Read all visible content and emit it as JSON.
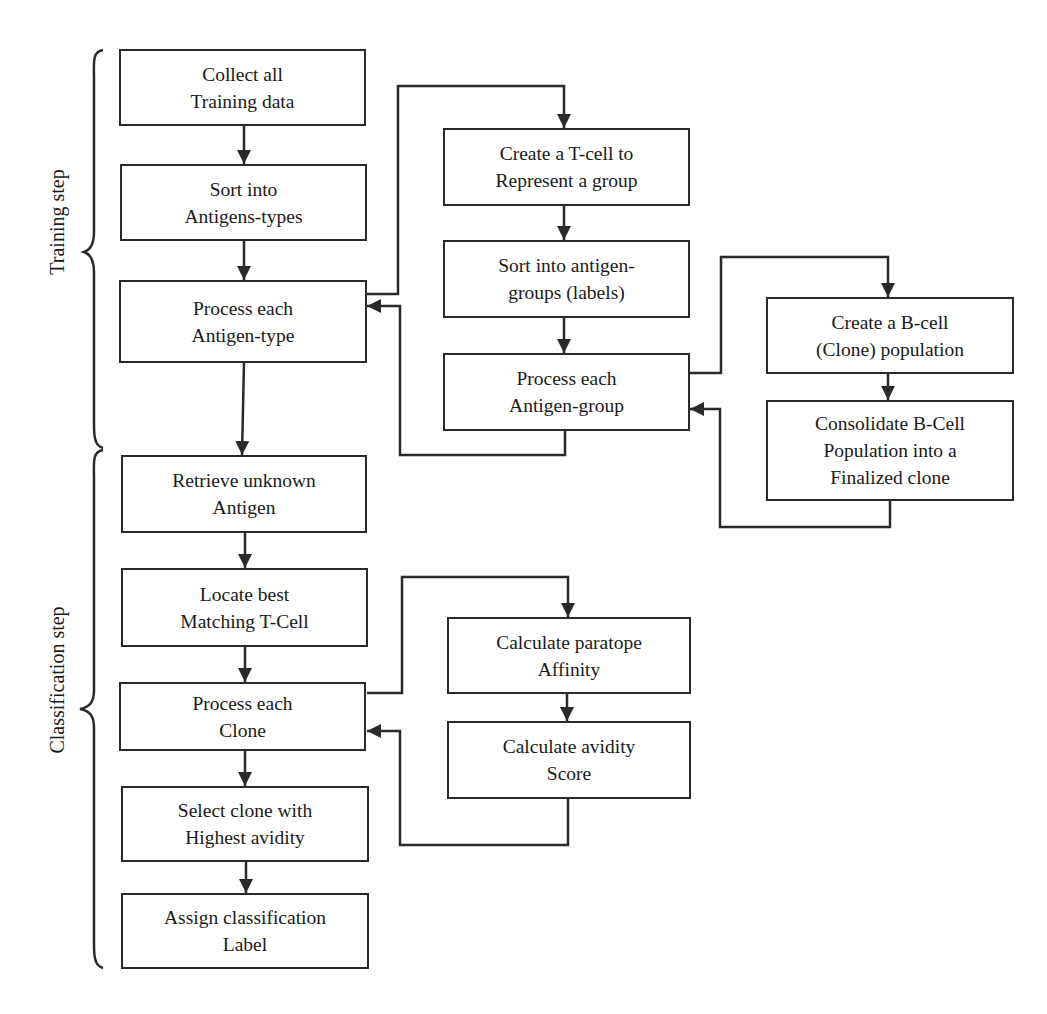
{
  "diagram": {
    "type": "flowchart",
    "colors": {
      "stroke": "#2a2a2a",
      "background": "#ffffff",
      "text": "#1a1a1a"
    },
    "phases": {
      "training": {
        "label": "Training step"
      },
      "classification": {
        "label": "Classification step"
      }
    },
    "nodes": {
      "collect": {
        "line1": "Collect all",
        "line2": "Training data"
      },
      "sort_types": {
        "line1": "Sort into",
        "line2": "Antigens-types"
      },
      "process_type": {
        "line1": "Process each",
        "line2": "Antigen-type"
      },
      "create_tcell": {
        "line1": "Create a T-cell to",
        "line2": "Represent a group"
      },
      "sort_groups": {
        "line1": "Sort into antigen-",
        "line2": "groups (labels)"
      },
      "process_group": {
        "line1": "Process each",
        "line2": "Antigen-group"
      },
      "create_bcell": {
        "line1": "Create a B-cell",
        "line2": "(Clone) population"
      },
      "consolidate": {
        "line1": "Consolidate B-Cell",
        "line2": "Population into a",
        "line3": "Finalized clone"
      },
      "retrieve": {
        "line1": "Retrieve unknown",
        "line2": "Antigen"
      },
      "locate": {
        "line1": "Locate best",
        "line2": "Matching T-Cell"
      },
      "process_clone": {
        "line1": "Process each",
        "line2": "Clone"
      },
      "calc_affinity": {
        "line1": "Calculate paratope",
        "line2": "Affinity"
      },
      "calc_avidity": {
        "line1": "Calculate avidity",
        "line2": "Score"
      },
      "select": {
        "line1": "Select clone with",
        "line2": "Highest avidity"
      },
      "assign": {
        "line1": "Assign classification",
        "line2": "Label"
      }
    },
    "edges": [
      [
        "collect",
        "sort_types"
      ],
      [
        "sort_types",
        "process_type"
      ],
      [
        "process_type",
        "create_tcell"
      ],
      [
        "create_tcell",
        "sort_groups"
      ],
      [
        "sort_groups",
        "process_group"
      ],
      [
        "process_group",
        "process_type"
      ],
      [
        "process_group",
        "create_bcell"
      ],
      [
        "create_bcell",
        "consolidate"
      ],
      [
        "consolidate",
        "process_group"
      ],
      [
        "process_type",
        "retrieve"
      ],
      [
        "retrieve",
        "locate"
      ],
      [
        "locate",
        "process_clone"
      ],
      [
        "process_clone",
        "calc_affinity"
      ],
      [
        "calc_affinity",
        "calc_avidity"
      ],
      [
        "calc_avidity",
        "process_clone"
      ],
      [
        "process_clone",
        "select"
      ],
      [
        "select",
        "assign"
      ]
    ]
  }
}
